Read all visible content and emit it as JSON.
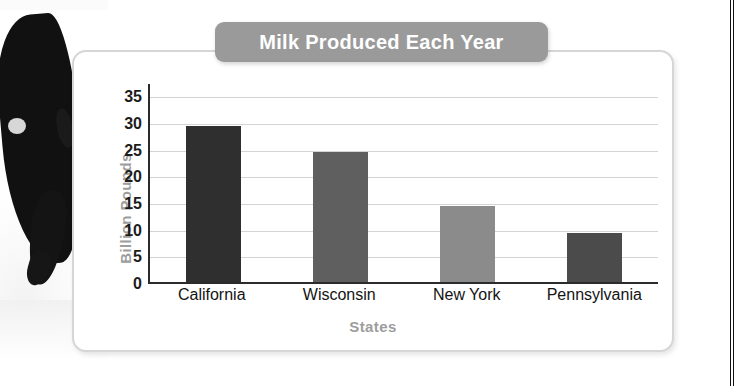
{
  "chart_data": {
    "type": "bar",
    "title": "Milk Produced Each Year",
    "xlabel": "States",
    "ylabel": "Billion Pounds",
    "categories": [
      "California",
      "Wisconsin",
      "New York",
      "Pennsylvania"
    ],
    "values": [
      29.2,
      24.3,
      14.3,
      9.2
    ],
    "ylim": [
      0,
      37.5
    ],
    "yticks": [
      0,
      5,
      10,
      15,
      20,
      25,
      30,
      35
    ],
    "ytick_labels": [
      "0",
      "5",
      "10",
      "15",
      "20",
      "25",
      "30",
      "35"
    ],
    "grid": true,
    "legend": "none",
    "bar_colors": [
      "#2f2f2f",
      "#5f5f5f",
      "#8b8b8b",
      "#4b4b4b"
    ]
  },
  "styles": {
    "title_banner_bg": "#9a9a9a",
    "title_text_color": "#ffffff",
    "axis_label_color": "#9d9d9d",
    "tick_text_color": "#1c1c1c",
    "gridline_color": "#d4d4d4",
    "axis_line_color": "#2b2b2b",
    "card_border_color": "#d6d6d6",
    "page_bg": "#ffffff"
  },
  "decor": {
    "photo_alt": "holstein-cow-photo"
  }
}
